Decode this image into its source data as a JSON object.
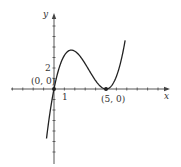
{
  "chart_data": {
    "type": "line",
    "title": "",
    "xlabel": "x",
    "ylabel": "y",
    "function": "y = 0.2·x·(x−5)²",
    "x_tick_labels": [
      "1"
    ],
    "y_tick_labels": [
      "2"
    ],
    "annotations": [
      {
        "label": "(0, 0)",
        "x": 0,
        "y": 0
      },
      {
        "label": "(5, 0)",
        "x": 5,
        "y": 0
      }
    ],
    "series": [
      {
        "name": "f(x)",
        "x": [
          -0.7,
          -0.5,
          0,
          0.5,
          1,
          1.5,
          1.67,
          2,
          2.5,
          3,
          3.5,
          4,
          4.5,
          5,
          5.5,
          6,
          6.5,
          7
        ],
        "y": [
          -4.6,
          -3.0,
          0,
          2.0,
          3.2,
          3.7,
          3.7,
          3.6,
          3.1,
          2.4,
          1.6,
          0.8,
          0.2,
          0,
          0.3,
          1.2,
          2.9,
          5.6
        ]
      }
    ],
    "xlim": [
      -5,
      11.5
    ],
    "ylim": [
      -7.5,
      8
    ],
    "grid": false,
    "legend": "none",
    "points": [
      {
        "x": 0,
        "y": 0
      },
      {
        "x": 5,
        "y": 0
      }
    ]
  },
  "labels": {
    "x_axis": "x",
    "y_axis": "y",
    "tick_x1": "1",
    "tick_y2": "2",
    "origin": "(0, 0)",
    "point5": "(5, 0)"
  }
}
